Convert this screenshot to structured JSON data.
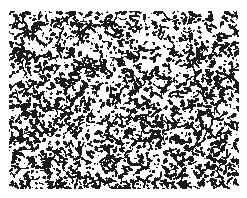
{
  "image": {
    "kind": "speckle-micrograph",
    "width": 247,
    "height": 198,
    "background_color": "#ffffff",
    "foreground_color": "#1a1a1a",
    "tone": "binary",
    "caption": "",
    "title": "",
    "scale_bar_label": "",
    "annotation": ""
  },
  "frame": {
    "margin_left": 9,
    "margin_top": 11,
    "margin_right": 8,
    "margin_bottom": 9,
    "content_left": 9,
    "content_top": 11,
    "content_right": 239,
    "content_bottom": 189,
    "border_visible": "false"
  },
  "texture": {
    "description": "High-contrast black speckle blobs and short curved filaments on white",
    "seed": 20240517,
    "coverage_fraction": 0.27,
    "blob_count": 2300,
    "blob_min_radius": 0.8,
    "blob_max_radius": 2.6,
    "filament_count": 620,
    "filament_min_length": 3,
    "filament_max_length": 11,
    "filament_thickness": 1.7,
    "threshold": 0.5,
    "density_map": {
      "top_left": 0.27,
      "top_center": 0.24,
      "top_right": 0.21,
      "mid_left": 0.3,
      "mid_center": 0.27,
      "mid_right": 0.25,
      "bottom_left": 0.31,
      "bottom_center": 0.32,
      "bottom_right": 0.28
    }
  },
  "chart_data": {
    "type": "heatmap",
    "title": "",
    "xlabel": "",
    "ylabel": "",
    "grid": "off",
    "legend": "none",
    "xlim": [
      0,
      247
    ],
    "ylim": [
      0,
      198
    ],
    "categories": [
      "top_left",
      "top_center",
      "top_right",
      "mid_left",
      "mid_center",
      "mid_right",
      "bottom_left",
      "bottom_center",
      "bottom_right"
    ],
    "values": [
      0.27,
      0.24,
      0.21,
      0.3,
      0.27,
      0.25,
      0.31,
      0.32,
      0.28
    ],
    "colorscale": [
      "#ffffff",
      "#1a1a1a"
    ]
  }
}
